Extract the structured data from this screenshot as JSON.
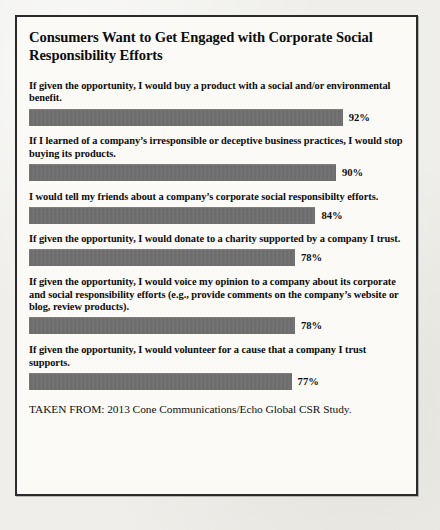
{
  "figure": {
    "title": "Consumers Want to Get Engaged with Corporate Social Responsibility Efforts",
    "source_note": "TAKEN FROM: 2013 Cone Communications/Echo Global CSR Study.",
    "bar_color": "#6e6e6e",
    "frame_color": "#2b2b2b",
    "page_background": "#efeeea",
    "panel_background": "#fbfaf7"
  },
  "chart_data": {
    "type": "bar",
    "orientation": "horizontal",
    "title": "Consumers Want to Get Engaged with Corporate Social Responsibility Efforts",
    "xlabel": "",
    "ylabel": "",
    "xlim": [
      0,
      100
    ],
    "grid": false,
    "legend": false,
    "value_suffix": "%",
    "categories": [
      "If given the opportunity, I would buy a product with a social and/or environmental benefit.",
      "If I learned of a company’s irresponsible or deceptive business practices, I would stop buying its products.",
      "I would tell my friends about a company’s corporate social responsibilty efforts.",
      "If given the opportunity, I would donate to a charity supported by a company I trust.",
      "If given the opportunity, I would voice my opinion to a company about its corporate and social responsibility efforts (e.g., provide comments on the company’s website or blog, review products).",
      "If given the opportunity, I would volunteer for a cause that a company I trust supports."
    ],
    "values": [
      92,
      90,
      84,
      78,
      78,
      77
    ],
    "value_labels": [
      "92%",
      "90%",
      "84%",
      "78%",
      "78%",
      "77%"
    ],
    "source": "TAKEN FROM: 2013 Cone Communications/Echo Global CSR Study."
  }
}
